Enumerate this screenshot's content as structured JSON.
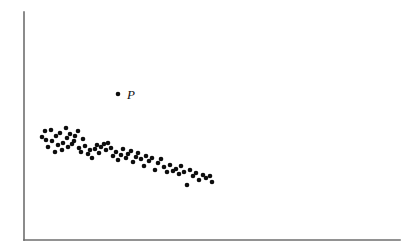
{
  "figure": {
    "width": 416,
    "height": 252,
    "background_color": "#ffffff",
    "point_color": "#0d0d0d",
    "axis_color": "#6e6e6e"
  },
  "axes": {
    "y_axis": {
      "x": 24,
      "y_top": 12,
      "y_bottom": 240
    },
    "x_axis": {
      "y": 240,
      "x_left": 24,
      "x_right": 400
    },
    "has_ticks": false,
    "has_tick_labels": false,
    "has_gridlines": false,
    "xlabel": "",
    "ylabel": ""
  },
  "annotations": [
    {
      "name": "outlier-p",
      "label": "P",
      "point_x": 118,
      "point_y": 94,
      "label_x": 127,
      "label_y": 99
    }
  ],
  "chart_data": {
    "type": "scatter",
    "title": "",
    "xlabel": "",
    "ylabel": "",
    "xlim": [
      24,
      400
    ],
    "ylim": [
      240,
      12
    ],
    "grid": false,
    "legend": null,
    "series": [
      {
        "name": "main-cloud",
        "marker": "filled-circle",
        "marker_radius": 2.3,
        "color": "#0d0d0d",
        "points": [
          [
            42,
            137
          ],
          [
            45,
            131
          ],
          [
            46,
            140
          ],
          [
            48,
            147
          ],
          [
            51,
            130
          ],
          [
            52,
            141
          ],
          [
            55,
            152
          ],
          [
            56,
            136
          ],
          [
            58,
            145
          ],
          [
            60,
            133
          ],
          [
            62,
            150
          ],
          [
            63,
            143
          ],
          [
            66,
            128
          ],
          [
            67,
            138
          ],
          [
            68,
            147
          ],
          [
            70,
            134
          ],
          [
            72,
            144
          ],
          [
            74,
            141
          ],
          [
            75,
            136
          ],
          [
            78,
            131
          ],
          [
            79,
            148
          ],
          [
            81,
            152
          ],
          [
            83,
            139
          ],
          [
            85,
            146
          ],
          [
            88,
            154
          ],
          [
            90,
            150
          ],
          [
            92,
            158
          ],
          [
            95,
            149
          ],
          [
            97,
            145
          ],
          [
            99,
            153
          ],
          [
            101,
            147
          ],
          [
            104,
            144
          ],
          [
            106,
            150
          ],
          [
            108,
            143
          ],
          [
            111,
            148
          ],
          [
            113,
            156
          ],
          [
            116,
            152
          ],
          [
            118,
            160
          ],
          [
            121,
            155
          ],
          [
            123,
            149
          ],
          [
            126,
            158
          ],
          [
            128,
            154
          ],
          [
            131,
            151
          ],
          [
            133,
            162
          ],
          [
            136,
            157
          ],
          [
            138,
            153
          ],
          [
            141,
            159
          ],
          [
            144,
            166
          ],
          [
            146,
            156
          ],
          [
            149,
            161
          ],
          [
            152,
            158
          ],
          [
            155,
            170
          ],
          [
            158,
            163
          ],
          [
            161,
            159
          ],
          [
            164,
            167
          ],
          [
            167,
            172
          ],
          [
            170,
            165
          ],
          [
            173,
            171
          ],
          [
            176,
            169
          ],
          [
            179,
            174
          ],
          [
            181,
            166
          ],
          [
            184,
            172
          ],
          [
            187,
            185
          ],
          [
            190,
            170
          ],
          [
            193,
            176
          ],
          [
            196,
            173
          ],
          [
            199,
            180
          ],
          [
            203,
            175
          ],
          [
            206,
            178
          ],
          [
            210,
            176
          ],
          [
            212,
            182
          ]
        ]
      }
    ],
    "outliers": [
      {
        "label": "P",
        "x": 118,
        "y": 94
      }
    ]
  }
}
